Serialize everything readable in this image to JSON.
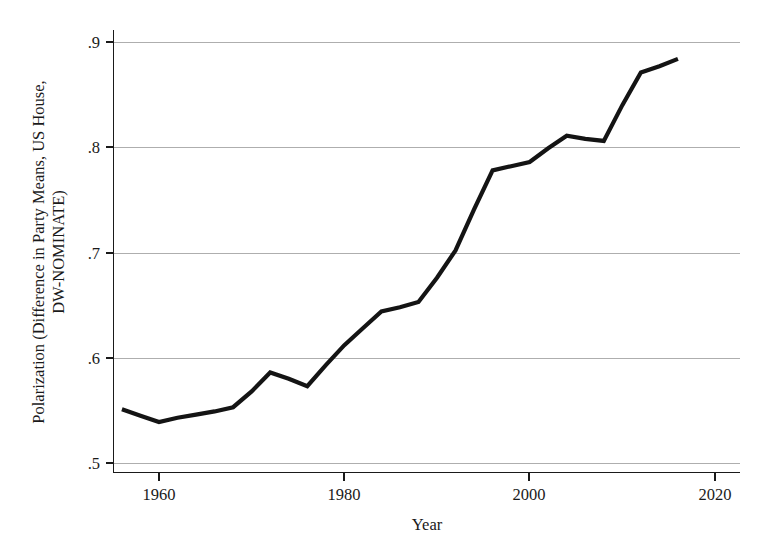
{
  "chart_data": {
    "type": "line",
    "title": "",
    "xlabel": "Year",
    "ylabel": "Polarization (Difference in Party Means, US House, DW-NOMINATE)",
    "ylabel_line1": "Polarization (Difference in Party Means, US House,",
    "ylabel_line2": "DW-NOMINATE)",
    "xlim": [
      1954,
      2021
    ],
    "ylim": [
      0.5,
      0.9
    ],
    "xticks": [
      1960,
      1980,
      2000,
      2020
    ],
    "xtick_labels": [
      "1960",
      "1980",
      "2000",
      "2020"
    ],
    "yticks": [
      0.5,
      0.6,
      0.7,
      0.8,
      0.9
    ],
    "ytick_labels": [
      ".5",
      ".6",
      ".7",
      ".8",
      ".9"
    ],
    "grid": "horizontal",
    "legend": "none",
    "series": [
      {
        "name": "Polarization",
        "color": "#141414",
        "x": [
          1956,
          1958,
          1960,
          1962,
          1964,
          1966,
          1968,
          1970,
          1972,
          1974,
          1976,
          1978,
          1980,
          1982,
          1984,
          1986,
          1988,
          1990,
          1992,
          1994,
          1996,
          1998,
          2000,
          2002,
          2004,
          2006,
          2008,
          2010,
          2012,
          2014,
          2016
        ],
        "values": [
          0.551,
          0.545,
          0.539,
          0.543,
          0.546,
          0.549,
          0.553,
          0.568,
          0.586,
          0.58,
          0.573,
          0.593,
          0.612,
          0.628,
          0.644,
          0.648,
          0.653,
          0.676,
          0.702,
          0.741,
          0.778,
          0.782,
          0.786,
          0.799,
          0.811,
          0.808,
          0.806,
          0.84,
          0.871,
          0.877,
          0.884
        ]
      }
    ]
  },
  "axes": {
    "x_axis_name": "Year",
    "y_axis_name": "Polarization (Difference in Party Means, US House, DW-NOMINATE)"
  }
}
